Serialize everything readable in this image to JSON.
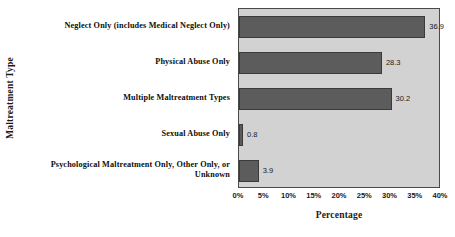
{
  "chart_data": {
    "type": "bar",
    "orientation": "horizontal",
    "title": "",
    "xlabel": "Percentage",
    "ylabel": "Maltreatment Type",
    "categories": [
      "Neglect Only (includes Medical Neglect Only)",
      "Physical Abuse Only",
      "Multiple Maltreatment Types",
      "Sexual Abuse Only",
      "Psychological Maltreatment Only, Other Only, or Unknown"
    ],
    "values": [
      36.9,
      28.3,
      30.2,
      0.8,
      3.9
    ],
    "value_labels": [
      "36.9",
      "28.3",
      "30.2",
      "0.8",
      "3.9"
    ],
    "xlim": [
      0,
      40
    ],
    "xticks": [
      0,
      5,
      10,
      15,
      20,
      25,
      30,
      35,
      40
    ],
    "xtick_labels": [
      "0%",
      "5%",
      "10%",
      "15%",
      "20%",
      "25%",
      "30%",
      "35%",
      "40%"
    ],
    "grid": false,
    "legend": null,
    "colors": {
      "bar": "#5c5c5c",
      "bar_border": "#3a3a3a",
      "plot_background": "#d2d2d2",
      "plot_border": "#4a4a4a",
      "page_background": "#ffffff",
      "text": "#1a1a1a"
    }
  }
}
